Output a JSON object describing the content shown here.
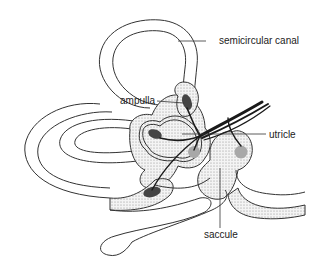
{
  "figure": {
    "labels": [
      {
        "id": "semicircular-canal",
        "text": "semicircular canal",
        "x": 219,
        "y": 44
      },
      {
        "id": "ampulla",
        "text": "ampulla",
        "x": 120,
        "y": 104
      },
      {
        "id": "utricle",
        "text": "utricle",
        "x": 269,
        "y": 138
      },
      {
        "id": "saccule",
        "text": "saccule",
        "x": 204,
        "y": 238
      }
    ]
  },
  "colors": {
    "line": "#333333",
    "stipple": "#b5b5b5",
    "hair_cell_dark": "#444444",
    "otolith_gray": "#a8a8a8",
    "background": "#ffffff"
  }
}
